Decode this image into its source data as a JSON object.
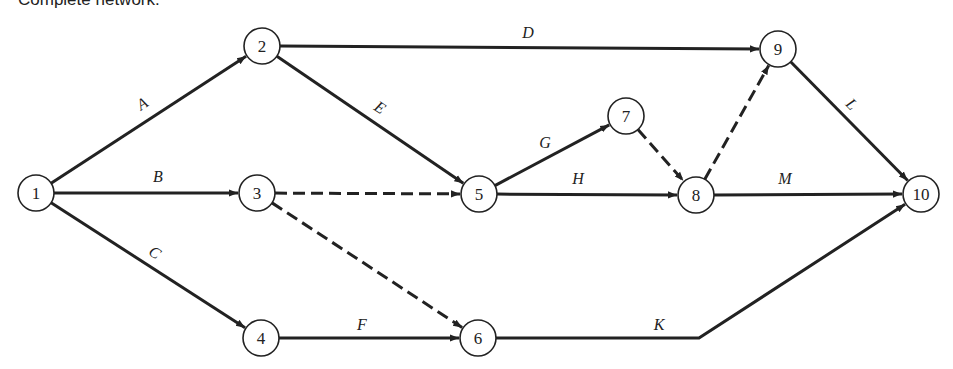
{
  "title": "Complete network.",
  "colors": {
    "stroke": "#222222",
    "background": "#ffffff"
  },
  "nodes": [
    {
      "id": "1",
      "x": 36,
      "y": 193
    },
    {
      "id": "2",
      "x": 262,
      "y": 46
    },
    {
      "id": "3",
      "x": 257,
      "y": 193
    },
    {
      "id": "4",
      "x": 261,
      "y": 338
    },
    {
      "id": "5",
      "x": 479,
      "y": 194
    },
    {
      "id": "6",
      "x": 478,
      "y": 338
    },
    {
      "id": "7",
      "x": 626,
      "y": 116
    },
    {
      "id": "8",
      "x": 696,
      "y": 195
    },
    {
      "id": "9",
      "x": 778,
      "y": 49
    },
    {
      "id": "10",
      "x": 921,
      "y": 194
    }
  ],
  "edges": [
    {
      "label": "A",
      "from": "1",
      "to": "2",
      "dashed": false
    },
    {
      "label": "B",
      "from": "1",
      "to": "3",
      "dashed": false
    },
    {
      "label": "C",
      "from": "1",
      "to": "4",
      "dashed": false
    },
    {
      "label": "D",
      "from": "2",
      "to": "9",
      "dashed": false
    },
    {
      "label": "E",
      "from": "2",
      "to": "5",
      "dashed": false
    },
    {
      "label": "",
      "from": "3",
      "to": "5",
      "dashed": true
    },
    {
      "label": "",
      "from": "3",
      "to": "6",
      "dashed": true
    },
    {
      "label": "F",
      "from": "4",
      "to": "6",
      "dashed": false
    },
    {
      "label": "G",
      "from": "5",
      "to": "7",
      "dashed": false
    },
    {
      "label": "H",
      "from": "5",
      "to": "8",
      "dashed": false
    },
    {
      "label": "",
      "from": "7",
      "to": "8",
      "dashed": true
    },
    {
      "label": "",
      "from": "8",
      "to": "9",
      "dashed": true
    },
    {
      "label": "L",
      "from": "9",
      "to": "10",
      "dashed": false
    },
    {
      "label": "M",
      "from": "8",
      "to": "10",
      "dashed": false
    },
    {
      "label": "K",
      "from": "6",
      "to": "10",
      "dashed": false,
      "via": [
        699,
        338
      ]
    }
  ],
  "edge_labels": [
    {
      "text": "A",
      "x": 145,
      "y": 108,
      "rotate": -33
    },
    {
      "text": "B",
      "x": 158,
      "y": 182,
      "rotate": 0
    },
    {
      "text": "C",
      "x": 152,
      "y": 257,
      "rotate": 33
    },
    {
      "text": "D",
      "x": 528,
      "y": 38,
      "rotate": 0
    },
    {
      "text": "E",
      "x": 377,
      "y": 112,
      "rotate": 33
    },
    {
      "text": "G",
      "x": 545,
      "y": 148,
      "rotate": 0
    },
    {
      "text": "H",
      "x": 578,
      "y": 184,
      "rotate": 0
    },
    {
      "text": "M",
      "x": 785,
      "y": 184,
      "rotate": 0
    },
    {
      "text": "L",
      "x": 848,
      "y": 108,
      "rotate": 45
    },
    {
      "text": "F",
      "x": 362,
      "y": 330,
      "rotate": 0
    },
    {
      "text": "K",
      "x": 659,
      "y": 330,
      "rotate": 0
    }
  ]
}
